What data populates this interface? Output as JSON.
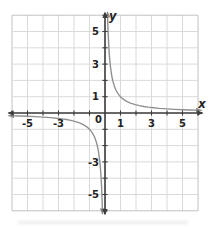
{
  "figure": {
    "origin_label": "0"
  },
  "chart_data": {
    "type": "line",
    "title": "",
    "equation": "y = 1/x",
    "asymptotes": {
      "vertical": "x = 0",
      "horizontal": "y = 0"
    },
    "xlabel": "x",
    "ylabel": "y",
    "xlim": [
      -6,
      6
    ],
    "ylim": [
      -6,
      6
    ],
    "grid": true,
    "tick_step": 1,
    "x_tick_values": [
      -5,
      -3,
      1,
      3,
      5
    ],
    "x_tick_labels": [
      "-5",
      "-3",
      "1",
      "3",
      "5"
    ],
    "y_tick_values": [
      5,
      3,
      1,
      -3,
      -5
    ],
    "y_tick_labels": [
      "5",
      "3",
      "1",
      "-3",
      "-5"
    ],
    "legend": null,
    "series": [
      {
        "name": "branch x > 0",
        "points": [
          [
            0.162,
            6.173
          ],
          [
            0.17,
            5.882
          ],
          [
            0.18,
            5.556
          ],
          [
            0.19,
            5.263
          ],
          [
            0.2,
            5.0
          ],
          [
            0.22,
            4.545
          ],
          [
            0.25,
            4.0
          ],
          [
            0.29,
            3.448
          ],
          [
            0.33,
            3.03
          ],
          [
            0.4,
            2.5
          ],
          [
            0.45,
            2.222
          ],
          [
            0.5,
            2.0
          ],
          [
            0.55,
            1.818
          ],
          [
            0.6,
            1.667
          ],
          [
            0.65,
            1.538
          ],
          [
            0.7,
            1.429
          ],
          [
            0.75,
            1.333
          ],
          [
            0.85,
            1.176
          ],
          [
            0.9,
            1.111
          ],
          [
            1.0,
            1.0
          ],
          [
            1.1,
            0.909
          ],
          [
            1.2,
            0.833
          ],
          [
            1.3,
            0.769
          ],
          [
            1.4,
            0.714
          ],
          [
            1.5,
            0.667
          ],
          [
            1.6,
            0.625
          ],
          [
            1.7,
            0.588
          ],
          [
            1.9,
            0.526
          ],
          [
            2.2,
            0.455
          ],
          [
            2.5,
            0.4
          ],
          [
            2.8,
            0.357
          ],
          [
            3.0,
            0.333
          ],
          [
            3.5,
            0.286
          ],
          [
            4.0,
            0.25
          ],
          [
            4.5,
            0.222
          ],
          [
            5.0,
            0.2
          ],
          [
            5.5,
            0.182
          ],
          [
            6.2,
            0.161
          ]
        ]
      },
      {
        "name": "branch x < 0",
        "points": [
          [
            -6.2,
            -0.161
          ],
          [
            -5.5,
            -0.182
          ],
          [
            -5.0,
            -0.2
          ],
          [
            -4.5,
            -0.222
          ],
          [
            -4.0,
            -0.25
          ],
          [
            -3.5,
            -0.286
          ],
          [
            -3.0,
            -0.333
          ],
          [
            -2.8,
            -0.357
          ],
          [
            -2.5,
            -0.4
          ],
          [
            -2.2,
            -0.455
          ],
          [
            -1.9,
            -0.526
          ],
          [
            -1.7,
            -0.588
          ],
          [
            -1.6,
            -0.625
          ],
          [
            -1.5,
            -0.667
          ],
          [
            -1.4,
            -0.714
          ],
          [
            -1.3,
            -0.769
          ],
          [
            -1.2,
            -0.833
          ],
          [
            -1.1,
            -0.909
          ],
          [
            -1.0,
            -1.0
          ],
          [
            -0.9,
            -1.111
          ],
          [
            -0.85,
            -1.176
          ],
          [
            -0.75,
            -1.333
          ],
          [
            -0.7,
            -1.429
          ],
          [
            -0.65,
            -1.538
          ],
          [
            -0.6,
            -1.667
          ],
          [
            -0.55,
            -1.818
          ],
          [
            -0.5,
            -2.0
          ],
          [
            -0.45,
            -2.222
          ],
          [
            -0.4,
            -2.5
          ],
          [
            -0.33,
            -3.03
          ],
          [
            -0.29,
            -3.448
          ],
          [
            -0.25,
            -4.0
          ],
          [
            -0.22,
            -4.545
          ],
          [
            -0.2,
            -5.0
          ],
          [
            -0.19,
            -5.263
          ],
          [
            -0.18,
            -5.556
          ],
          [
            -0.17,
            -5.882
          ],
          [
            -0.162,
            -6.173
          ]
        ]
      }
    ],
    "colors": {
      "grid_inner": "#dadada",
      "grid_border": "#c2c2c2",
      "axis": "#3d3d3d",
      "curve": "#909090",
      "label": "#222222",
      "background": "#ffffff"
    }
  }
}
